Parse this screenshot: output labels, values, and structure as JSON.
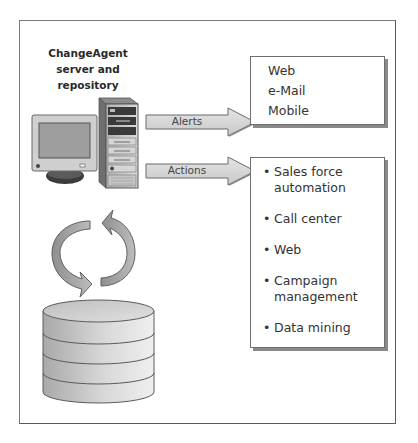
{
  "diagram": {
    "server": {
      "title_lines": [
        "ChangeAgent",
        "server and",
        "repository"
      ]
    },
    "arrows": {
      "alerts": "Alerts",
      "actions": "Actions"
    },
    "channels": {
      "items": [
        "Web",
        "e-Mail",
        "Mobile"
      ]
    },
    "actions_targets": {
      "bullet": "•",
      "items": [
        {
          "line1": "Sales force",
          "line2": "automation"
        },
        {
          "line1": "Call center",
          "line2": ""
        },
        {
          "line1": "Web",
          "line2": ""
        },
        {
          "line1": "Campaign",
          "line2": "management"
        },
        {
          "line1": "Data mining",
          "line2": ""
        }
      ]
    },
    "icons": {
      "monitor": "computer-monitor-icon",
      "server": "server-tower-icon",
      "sync": "sync-cycle-arrows-icon",
      "database": "database-cylinder-icon"
    },
    "colors": {
      "frame": "#7a7a7a",
      "arrow_fill": "#d6d6d6",
      "arrow_stroke": "#6a6a6a",
      "box_shadow": "#8a8a8a",
      "sync_arrow": "#9a9a9a",
      "database": "#c8c8c8"
    }
  }
}
